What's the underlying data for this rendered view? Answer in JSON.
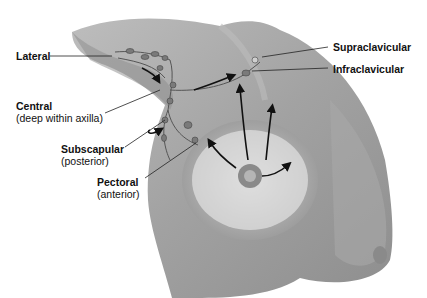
{
  "diagram": {
    "labels": [
      {
        "id": "lateral",
        "title": "Lateral",
        "subtitle": ""
      },
      {
        "id": "central",
        "title": "Central",
        "subtitle": "(deep within axilla)"
      },
      {
        "id": "subscapular",
        "title": "Subscapular",
        "subtitle": "(posterior)"
      },
      {
        "id": "pectoral",
        "title": "Pectoral",
        "subtitle": "(anterior)"
      },
      {
        "id": "supraclavicular",
        "title": "Supraclavicular",
        "subtitle": ""
      },
      {
        "id": "infraclavicular",
        "title": "Infraclavicular",
        "subtitle": ""
      }
    ],
    "colors": {
      "skin": "#9a9a9a",
      "skin_light": "#c8c8c8",
      "gland": "#e6e6e6",
      "node": "#7a7a7a",
      "text": "#111111",
      "arrow": "#111111"
    }
  }
}
